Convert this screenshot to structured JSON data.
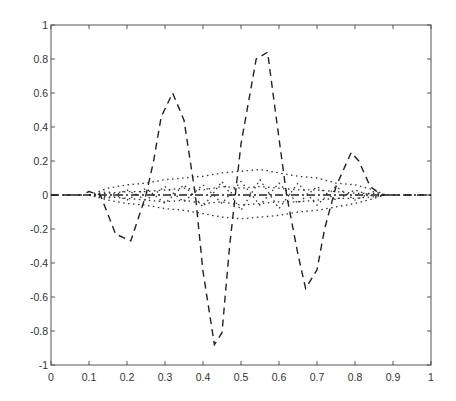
{
  "chart_data": {
    "type": "line",
    "title": "",
    "xlabel": "",
    "ylabel": "",
    "xlim": [
      0,
      1
    ],
    "ylim": [
      -1,
      1
    ],
    "grid": false,
    "legend": null,
    "x_ticks": [
      "0",
      "0.1",
      "0.2",
      "0.3",
      "0.4",
      "0.5",
      "0.6",
      "0.7",
      "0.8",
      "0.9",
      "1"
    ],
    "y_ticks": [
      "1",
      "0.8",
      "0.6",
      "0.4",
      "0.2",
      "0",
      "-0.2",
      "-0.4",
      "-0.6",
      "-0.8",
      "-1"
    ],
    "series": [
      {
        "name": "dashed",
        "style": "dashed",
        "color": "#222222",
        "x": [
          0.0,
          0.05,
          0.08,
          0.1,
          0.13,
          0.17,
          0.21,
          0.25,
          0.27,
          0.29,
          0.32,
          0.35,
          0.38,
          0.4,
          0.43,
          0.45,
          0.47,
          0.5,
          0.54,
          0.57,
          0.59,
          0.62,
          0.65,
          0.67,
          0.7,
          0.72,
          0.75,
          0.77,
          0.79,
          0.81,
          0.84,
          0.87,
          0.9,
          1.0
        ],
        "y": [
          0.0,
          0.0,
          0.0,
          0.02,
          0.0,
          -0.23,
          -0.27,
          0.0,
          0.2,
          0.46,
          0.6,
          0.44,
          0.0,
          -0.45,
          -0.88,
          -0.81,
          -0.3,
          0.3,
          0.8,
          0.84,
          0.5,
          0.0,
          -0.35,
          -0.55,
          -0.44,
          -0.2,
          0.05,
          0.15,
          0.25,
          0.2,
          0.05,
          0.0,
          0.0,
          0.0
        ]
      },
      {
        "name": "dotted-1",
        "style": "dotted",
        "color": "#333333",
        "x": [
          0.1,
          0.15,
          0.2,
          0.25,
          0.3,
          0.35,
          0.4,
          0.45,
          0.5,
          0.55,
          0.6,
          0.65,
          0.7,
          0.75,
          0.8,
          0.85,
          0.88
        ],
        "y": [
          0.0,
          0.04,
          0.06,
          0.07,
          0.09,
          0.1,
          0.11,
          0.13,
          0.14,
          0.15,
          0.13,
          0.11,
          0.1,
          0.07,
          0.06,
          0.03,
          0.0
        ]
      },
      {
        "name": "dotted-2",
        "style": "dotted",
        "color": "#333333",
        "x": [
          0.1,
          0.15,
          0.2,
          0.25,
          0.3,
          0.35,
          0.4,
          0.45,
          0.5,
          0.55,
          0.6,
          0.65,
          0.7,
          0.75,
          0.8,
          0.85,
          0.88
        ],
        "y": [
          0.0,
          -0.02,
          0.03,
          -0.03,
          0.05,
          -0.04,
          0.06,
          -0.05,
          0.08,
          -0.06,
          0.07,
          -0.05,
          0.05,
          -0.03,
          0.03,
          -0.01,
          0.0
        ]
      },
      {
        "name": "dotted-3",
        "style": "dotted",
        "color": "#333333",
        "x": [
          0.1,
          0.15,
          0.2,
          0.25,
          0.3,
          0.35,
          0.4,
          0.45,
          0.5,
          0.55,
          0.6,
          0.65,
          0.7,
          0.75,
          0.8,
          0.85,
          0.88
        ],
        "y": [
          0.0,
          0.02,
          -0.03,
          0.04,
          -0.05,
          0.06,
          -0.07,
          0.08,
          -0.09,
          0.09,
          -0.08,
          0.07,
          -0.06,
          0.05,
          -0.03,
          0.02,
          0.0
        ]
      },
      {
        "name": "dotted-4",
        "style": "dotted",
        "color": "#333333",
        "x": [
          0.1,
          0.15,
          0.2,
          0.25,
          0.3,
          0.35,
          0.4,
          0.45,
          0.5,
          0.55,
          0.6,
          0.65,
          0.7,
          0.75,
          0.8,
          0.85,
          0.88
        ],
        "y": [
          0.0,
          -0.03,
          -0.05,
          -0.06,
          -0.08,
          -0.09,
          -0.11,
          -0.13,
          -0.14,
          -0.13,
          -0.12,
          -0.1,
          -0.09,
          -0.07,
          -0.05,
          -0.02,
          0.0
        ]
      },
      {
        "name": "dotted-5",
        "style": "dotted",
        "color": "#333333",
        "x": [
          0.1,
          0.15,
          0.2,
          0.25,
          0.3,
          0.35,
          0.4,
          0.45,
          0.5,
          0.55,
          0.6,
          0.65,
          0.7,
          0.75,
          0.8,
          0.85,
          0.88
        ],
        "y": [
          0.0,
          0.01,
          0.02,
          0.02,
          0.03,
          0.04,
          0.03,
          0.05,
          0.04,
          0.05,
          0.04,
          0.03,
          0.03,
          0.02,
          0.01,
          0.01,
          0.0
        ]
      },
      {
        "name": "dotted-6",
        "style": "dotted",
        "color": "#333333",
        "x": [
          0.1,
          0.15,
          0.2,
          0.25,
          0.3,
          0.35,
          0.4,
          0.45,
          0.5,
          0.55,
          0.6,
          0.65,
          0.7,
          0.75,
          0.8,
          0.85,
          0.88
        ],
        "y": [
          0.0,
          -0.01,
          -0.02,
          -0.03,
          -0.04,
          -0.03,
          -0.05,
          -0.04,
          -0.06,
          -0.05,
          -0.04,
          -0.04,
          -0.03,
          -0.02,
          -0.02,
          -0.01,
          0.0
        ]
      },
      {
        "name": "dash-dot-baseline",
        "style": "dashdot",
        "color": "#222222",
        "x": [
          0.0,
          0.1,
          0.87,
          1.0
        ],
        "y": [
          0.0,
          0.0,
          0.0,
          0.0
        ]
      }
    ]
  },
  "layout": {
    "plot_left": 51,
    "plot_top": 25,
    "plot_width": 380,
    "plot_height": 340
  }
}
